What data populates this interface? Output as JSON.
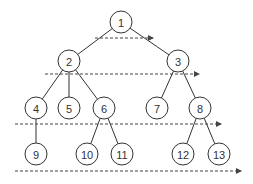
{
  "diagram": {
    "type": "tree-level-order-traversal",
    "nodes": [
      {
        "id": "1",
        "x": 121,
        "y": 22
      },
      {
        "id": "2",
        "x": 69,
        "y": 61
      },
      {
        "id": "3",
        "x": 178,
        "y": 61
      },
      {
        "id": "4",
        "x": 36,
        "y": 108
      },
      {
        "id": "5",
        "x": 69,
        "y": 108
      },
      {
        "id": "6",
        "x": 104,
        "y": 108
      },
      {
        "id": "7",
        "x": 157,
        "y": 108
      },
      {
        "id": "8",
        "x": 200,
        "y": 108
      },
      {
        "id": "9",
        "x": 36,
        "y": 154
      },
      {
        "id": "10",
        "x": 87,
        "y": 154
      },
      {
        "id": "11",
        "x": 122,
        "y": 154
      },
      {
        "id": "12",
        "x": 183,
        "y": 154
      },
      {
        "id": "13",
        "x": 219,
        "y": 154
      }
    ],
    "edges": [
      [
        "1",
        "2"
      ],
      [
        "1",
        "3"
      ],
      [
        "2",
        "4"
      ],
      [
        "2",
        "5"
      ],
      [
        "2",
        "6"
      ],
      [
        "3",
        "7"
      ],
      [
        "3",
        "8"
      ],
      [
        "4",
        "9"
      ],
      [
        "6",
        "10"
      ],
      [
        "6",
        "11"
      ],
      [
        "8",
        "12"
      ],
      [
        "8",
        "13"
      ]
    ],
    "level_arrows": [
      {
        "y": 38,
        "x1": 95,
        "x2": 153
      },
      {
        "y": 74,
        "x1": 45,
        "x2": 199
      },
      {
        "y": 124,
        "x1": 15,
        "x2": 221
      },
      {
        "y": 171,
        "x1": 15,
        "x2": 241
      }
    ],
    "colors": {
      "stroke": "#333333",
      "background": "#ffffff"
    }
  }
}
